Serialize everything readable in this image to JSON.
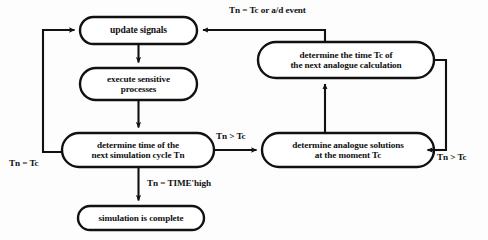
{
  "diagram": {
    "type": "flowchart",
    "colors": {
      "stroke": "#111111",
      "fill": "#ffffff",
      "background": "#fdfdfd",
      "text": "#111111"
    },
    "nodes": [
      {
        "id": "update-signals",
        "label": "update signals",
        "shape": "stadium",
        "x": 80,
        "y": 17,
        "w": 117,
        "h": 27,
        "font_size": 9.6
      },
      {
        "id": "execute-sensitive-processes",
        "label": "execute sensitive\nprocesses",
        "shape": "stadium",
        "x": 80,
        "y": 68,
        "w": 117,
        "h": 32,
        "font_size": 9.2
      },
      {
        "id": "determine-next-simulation-cycle",
        "label": "determine time of the\nnext simulation cycle Tn",
        "shape": "stadium",
        "x": 62,
        "y": 133,
        "w": 152,
        "h": 34,
        "font_size": 9.2
      },
      {
        "id": "simulation-is-complete",
        "label": "simulation is complete",
        "shape": "stadium",
        "x": 78,
        "y": 206,
        "w": 126,
        "h": 24,
        "font_size": 9.2
      },
      {
        "id": "determine-time-tc",
        "label": "determine the time Tc of\nthe next analogue calculation",
        "shape": "stadium",
        "x": 258,
        "y": 42,
        "w": 176,
        "h": 36,
        "font_size": 9.2
      },
      {
        "id": "determine-analogue-solutions",
        "label": "determine analogue solutions\nat the moment Tc",
        "shape": "stadium",
        "x": 262,
        "y": 133,
        "w": 172,
        "h": 34,
        "font_size": 9.2
      }
    ],
    "edge_labels": [
      {
        "id": "label-tn-eq-tc-or-ad-event",
        "text": "Tn = Tc or a/d event",
        "x": 229,
        "y": 5,
        "font_size": 9.2
      },
      {
        "id": "label-tn-gt-tc-middle",
        "text": "Tn > Tc",
        "x": 216,
        "y": 131,
        "font_size": 9.2
      },
      {
        "id": "label-tn-eq-tc-left",
        "text": "Tn = Tc",
        "x": 9,
        "y": 158,
        "font_size": 9.2
      },
      {
        "id": "label-tn-eq-time-high",
        "text": "Tn = TIME'high",
        "x": 147,
        "y": 178,
        "font_size": 9.2
      },
      {
        "id": "label-tn-gt-tc-right",
        "text": "Tn > Tc",
        "x": 437,
        "y": 152,
        "font_size": 9.2
      }
    ],
    "edges": [
      {
        "id": "edge-update-to-execute",
        "from": "update-signals",
        "to": "execute-sensitive-processes"
      },
      {
        "id": "edge-execute-to-determine-cycle",
        "from": "execute-sensitive-processes",
        "to": "determine-next-simulation-cycle"
      },
      {
        "id": "edge-cycle-to-complete",
        "from": "determine-next-simulation-cycle",
        "to": "simulation-is-complete",
        "label": "Tn = TIME'high"
      },
      {
        "id": "edge-cycle-to-analogue",
        "from": "determine-next-simulation-cycle",
        "to": "determine-analogue-solutions",
        "label": "Tn > Tc"
      },
      {
        "id": "edge-cycle-to-update-feedback",
        "from": "determine-next-simulation-cycle",
        "to": "update-signals",
        "label": "Tn = Tc"
      },
      {
        "id": "edge-analogue-to-time-tc",
        "from": "determine-analogue-solutions",
        "to": "determine-time-tc"
      },
      {
        "id": "edge-time-tc-to-update",
        "from": "determine-time-tc",
        "to": "update-signals",
        "label": "Tn = Tc or a/d event"
      },
      {
        "id": "edge-time-tc-to-analogue-feedback",
        "from": "determine-time-tc",
        "to": "determine-analogue-solutions",
        "label": "Tn > Tc"
      }
    ]
  }
}
